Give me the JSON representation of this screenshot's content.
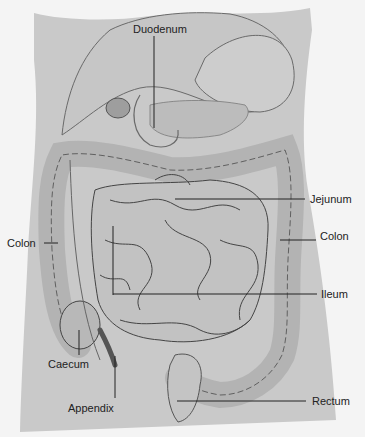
{
  "diagram": {
    "colors": {
      "background": "#f4f4f4",
      "body": "#c9c9c9",
      "organ": "#bdbdbd",
      "organ_light": "#cfcfcf",
      "outline": "#3a3a3a",
      "leader": "#222222"
    },
    "labels": [
      {
        "id": "duodenum",
        "text": "Duodenum",
        "x": 133,
        "y": 23
      },
      {
        "id": "jejunum",
        "text": "Jejunum",
        "x": 310,
        "y": 47
      },
      {
        "id": "colon-left",
        "text": "Colon",
        "x": 7,
        "y": 236
      },
      {
        "id": "colon-right",
        "text": "Colon",
        "x": 320,
        "y": 231
      },
      {
        "id": "ileum",
        "text": "Ileum",
        "x": 321,
        "y": 290
      },
      {
        "id": "caecum",
        "text": "Caecum",
        "x": 48,
        "y": 358
      },
      {
        "id": "appendix",
        "text": "Appendix",
        "x": 68,
        "y": 401
      },
      {
        "id": "rectum",
        "text": "Rectum",
        "x": 312,
        "y": 395
      }
    ]
  }
}
